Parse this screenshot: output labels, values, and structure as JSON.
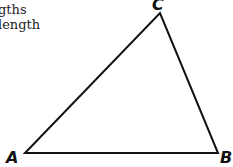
{
  "text": {
    "line1": "gths",
    "line2": "length"
  },
  "diagram": {
    "type": "triangle",
    "stroke_color": "#111111",
    "vertices": [
      {
        "label": "A",
        "x": 25,
        "y": 153
      },
      {
        "label": "B",
        "x": 218,
        "y": 153
      },
      {
        "label": "C",
        "x": 160,
        "y": 13
      }
    ]
  }
}
